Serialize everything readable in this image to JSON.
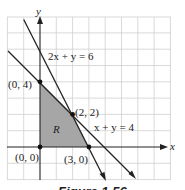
{
  "diagram": {
    "type": "linear-programming-feasible-region",
    "axes": {
      "x_label": "x",
      "y_label": "y"
    },
    "grid": {
      "x_range": [
        -2,
        8
      ],
      "y_range": [
        -2,
        8
      ],
      "step": 1
    },
    "lines": [
      {
        "equation": "2x + y = 6",
        "label": "2x + y = 6"
      },
      {
        "equation": "x + y = 4",
        "label": "x + y = 4"
      }
    ],
    "region_label": "R",
    "vertices": [
      {
        "x": 0,
        "y": 4,
        "label": "(0, 4)"
      },
      {
        "x": 2,
        "y": 2,
        "label": "(2, 2)"
      },
      {
        "x": 0,
        "y": 0,
        "label": "(0, 0)"
      },
      {
        "x": 3,
        "y": 0,
        "label": "(3, 0)"
      }
    ],
    "caption": "Figure 1.56",
    "colors": {
      "region": "#a6a6a6",
      "line": "#222222",
      "grid": "#cccccc"
    }
  }
}
